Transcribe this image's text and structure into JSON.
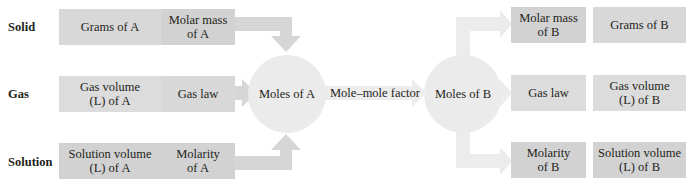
{
  "colors": {
    "box_light": "#dcdcdc",
    "box_medium": "#d2d2d2",
    "arrow": "#d6d6d6",
    "arrow_faint": "#ececec",
    "circle": "#ebebeb",
    "text": "#231f20"
  },
  "row_labels": {
    "solid": "Solid",
    "gas": "Gas",
    "solution": "Solution"
  },
  "substance_a": {
    "solid": {
      "quantity": "Grams of A",
      "conversion": "Molar mass\nof A"
    },
    "gas": {
      "quantity": "Gas volume\n(L) of A",
      "conversion": "Gas law"
    },
    "solution": {
      "quantity": "Solution volume\n(L) of A",
      "conversion": "Molarity\nof A"
    },
    "moles": "Moles of A"
  },
  "mole_mole_factor": "Mole–mole factor",
  "substance_b": {
    "moles": "Moles of B",
    "solid": {
      "conversion": "Molar mass\nof B",
      "quantity": "Grams of B"
    },
    "gas": {
      "conversion": "Gas law",
      "quantity": "Gas volume\n(L) of B"
    },
    "solution": {
      "conversion": "Molarity\nof B",
      "quantity": "Solution volume\n(L) of B"
    }
  }
}
